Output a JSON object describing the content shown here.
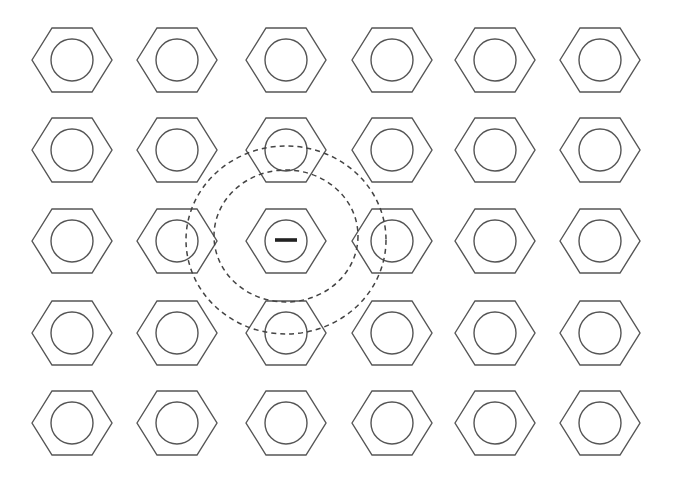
{
  "diagram": {
    "grid": {
      "columns_x": [
        72,
        177,
        286,
        392,
        495,
        600
      ],
      "rows_y": [
        60,
        150,
        241,
        333,
        423
      ],
      "hex_half_width": 40,
      "hex_half_height": 32,
      "hex_edge_half": 20,
      "circle_radius": 21
    },
    "center_cell": {
      "col": 2,
      "row": 2,
      "symbol": "minus",
      "label": "−"
    },
    "dashed_boundaries": [
      {
        "name": "inner",
        "cx": 286,
        "cy": 236,
        "rx": 72,
        "ry": 66
      },
      {
        "name": "outer",
        "cx": 286,
        "cy": 240,
        "rx": 100,
        "ry": 94
      }
    ],
    "colors": {
      "line": "#555555",
      "dash": "#444444",
      "symbol": "#222222",
      "background": "#ffffff"
    }
  }
}
